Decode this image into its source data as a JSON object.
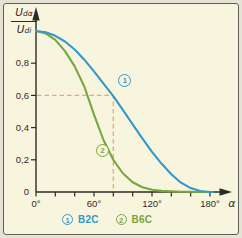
{
  "figure": {
    "type_note": "textbook chart: relative DC output voltage vs firing angle",
    "colors": {
      "background": "#f8f5de",
      "outer_margin": "#e5e3d6",
      "frame_border": "#5f6156",
      "ink": "#2b2b25",
      "blue": "#3598ca",
      "green": "#79a640",
      "guide": "#e8a87c"
    },
    "y_axis_label": {
      "numerator_base": "U",
      "numerator_sub": "dα",
      "denominator_base": "U",
      "denominator_sub": "di"
    }
  },
  "chart_data": {
    "type": "line",
    "title": "",
    "xlabel": "α",
    "ylabel": "Udα/Udi",
    "x_unit": "degrees",
    "xlim": [
      0,
      186
    ],
    "ylim": [
      0,
      1.05
    ],
    "grid": false,
    "legend_position": "bottom",
    "xticks": [
      {
        "deg": 0,
        "label": "0°"
      },
      {
        "deg": 20,
        "label": ""
      },
      {
        "deg": 40,
        "label": ""
      },
      {
        "deg": 60,
        "label": "60°"
      },
      {
        "deg": 80,
        "label": ""
      },
      {
        "deg": 100,
        "label": ""
      },
      {
        "deg": 120,
        "label": "120°"
      },
      {
        "deg": 140,
        "label": ""
      },
      {
        "deg": 160,
        "label": ""
      },
      {
        "deg": 180,
        "label": "180°"
      }
    ],
    "yticks": [
      {
        "v": 0,
        "label": "0"
      },
      {
        "v": 0.2,
        "label": "0,2"
      },
      {
        "v": 0.4,
        "label": "0,4"
      },
      {
        "v": 0.6,
        "label": "0,6"
      },
      {
        "v": 0.8,
        "label": "0,8"
      }
    ],
    "series": [
      {
        "name": "B6C",
        "marker_num": "2",
        "color": "#79a640",
        "points": [
          [
            0,
            1.0
          ],
          [
            10,
            0.985
          ],
          [
            20,
            0.945
          ],
          [
            30,
            0.875
          ],
          [
            40,
            0.78
          ],
          [
            50,
            0.655
          ],
          [
            60,
            0.48
          ],
          [
            70,
            0.32
          ],
          [
            80,
            0.2
          ],
          [
            90,
            0.115
          ],
          [
            100,
            0.06
          ],
          [
            110,
            0.03
          ],
          [
            120,
            0.014
          ],
          [
            130,
            0.007
          ],
          [
            140,
            0.004
          ],
          [
            150,
            0.002
          ],
          [
            160,
            0.001
          ],
          [
            170,
            0.0
          ],
          [
            183,
            0.0
          ]
        ]
      },
      {
        "name": "B2C",
        "marker_num": "1",
        "color": "#3598ca",
        "points": [
          [
            0,
            1.0
          ],
          [
            10,
            0.992
          ],
          [
            20,
            0.97
          ],
          [
            30,
            0.935
          ],
          [
            40,
            0.885
          ],
          [
            50,
            0.822
          ],
          [
            60,
            0.75
          ],
          [
            70,
            0.672
          ],
          [
            80,
            0.595
          ],
          [
            90,
            0.508
          ],
          [
            100,
            0.42
          ],
          [
            110,
            0.333
          ],
          [
            120,
            0.25
          ],
          [
            130,
            0.175
          ],
          [
            140,
            0.11
          ],
          [
            150,
            0.058
          ],
          [
            160,
            0.024
          ],
          [
            170,
            0.006
          ],
          [
            180,
            0.0
          ],
          [
            183,
            0.0
          ]
        ]
      }
    ],
    "markers": [
      {
        "series": "B2C",
        "num": "1",
        "alpha": 92,
        "ratio": 0.69
      },
      {
        "series": "B6C",
        "num": "2",
        "alpha": 69,
        "ratio": 0.255
      }
    ],
    "guides": {
      "alpha_deg": 80,
      "ratio": 0.6,
      "style": "dashed"
    },
    "legend": [
      {
        "num": "1",
        "label": "B2C",
        "color": "#3598ca"
      },
      {
        "num": "2",
        "label": "B6C",
        "color": "#79a640"
      }
    ]
  }
}
